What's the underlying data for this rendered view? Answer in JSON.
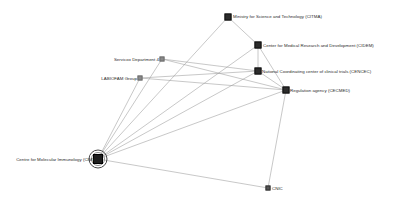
{
  "diagram": {
    "type": "network-graph",
    "title": "",
    "background_color": "#ffffff",
    "node_color": "#2c2c2c",
    "edge_color": "#9a9a9a",
    "highlight_color": "#4a4a4a",
    "nodes": [
      {
        "id": "mincyt",
        "label": "Ministry for Science and Technology (CITMA)",
        "x": 228,
        "y": 17,
        "marker": "square-dark",
        "label_side": "right",
        "label_dx": 5,
        "label_dy": -1
      },
      {
        "id": "cidem",
        "label": "Center for Medical Research and Development (CIDEM)",
        "x": 258,
        "y": 45,
        "marker": "square-dark",
        "label_side": "right",
        "label_dx": 5,
        "label_dy": 0
      },
      {
        "id": "cencec",
        "label": "National Coordinating center of clinical trials (CENCEC)",
        "x": 258,
        "y": 71,
        "marker": "square-dark",
        "label_side": "right",
        "label_dx": 4,
        "label_dy": 0
      },
      {
        "id": "cecmed",
        "label": "Regulation agency (CECMED)",
        "x": 286,
        "y": 90,
        "marker": "square-dark",
        "label_side": "right",
        "label_dx": 4,
        "label_dy": 0
      },
      {
        "id": "servicios",
        "label": "Servicox Department 4",
        "x": 162,
        "y": 59,
        "marker": "square-light",
        "label_side": "left",
        "label_dx": -3,
        "label_dy": 0
      },
      {
        "id": "labiofam",
        "label": "LABIOFAM Group",
        "x": 140,
        "y": 78,
        "marker": "square-light",
        "label_side": "left",
        "label_dx": -3,
        "label_dy": 0
      },
      {
        "id": "cim",
        "label": "Centre for Molecular Immunology (CIM)",
        "x": 98,
        "y": 159,
        "marker": "square-hub-highlighted",
        "label_side": "left",
        "label_dx": -4,
        "label_dy": 0
      },
      {
        "id": "cnic",
        "label": "CNIC",
        "x": 268,
        "y": 188,
        "marker": "square-small",
        "label_side": "right",
        "label_dx": 4,
        "label_dy": 0
      }
    ],
    "edges": [
      {
        "from": "cim",
        "to": "mincyt"
      },
      {
        "from": "cim",
        "to": "cidem"
      },
      {
        "from": "cim",
        "to": "cencec"
      },
      {
        "from": "cim",
        "to": "cecmed"
      },
      {
        "from": "cim",
        "to": "servicios"
      },
      {
        "from": "cim",
        "to": "labiofam"
      },
      {
        "from": "cim",
        "to": "cnic"
      },
      {
        "from": "mincyt",
        "to": "cidem"
      },
      {
        "from": "cidem",
        "to": "cencec"
      },
      {
        "from": "cidem",
        "to": "cecmed"
      },
      {
        "from": "cencec",
        "to": "cecmed"
      },
      {
        "from": "servicios",
        "to": "cencec"
      },
      {
        "from": "servicios",
        "to": "cecmed"
      },
      {
        "from": "labiofam",
        "to": "cencec"
      },
      {
        "from": "labiofam",
        "to": "cecmed"
      },
      {
        "from": "cecmed",
        "to": "cnic"
      }
    ],
    "selected_node": "cim"
  }
}
